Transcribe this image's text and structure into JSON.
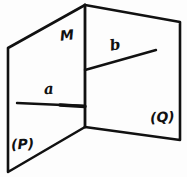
{
  "figure": {
    "kind": "hand-drawn-geometry-diagram",
    "ink_color": "#111111",
    "background_color": "#fdfdfd",
    "labels": {
      "plane_left": "(P)",
      "plane_right": "(Q)",
      "point_fold": "M",
      "line_left": "a",
      "line_right": "b"
    },
    "geometry": {
      "fold_line": {
        "top": [
          85,
          5
        ],
        "bottom": [
          85,
          127
        ]
      },
      "plane_left_outline": [
        [
          85,
          5
        ],
        [
          8,
          48
        ],
        [
          8,
          172
        ],
        [
          85,
          127
        ]
      ],
      "plane_right_outline": [
        [
          85,
          5
        ],
        [
          180,
          22
        ],
        [
          180,
          140
        ],
        [
          85,
          127
        ]
      ],
      "line_a": {
        "from": [
          17,
          103
        ],
        "to": [
          85,
          106
        ]
      },
      "line_b": {
        "from": [
          85,
          70
        ],
        "to": [
          156,
          50
        ]
      }
    }
  }
}
